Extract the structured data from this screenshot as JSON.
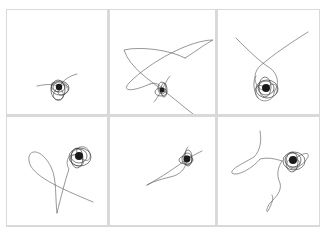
{
  "figure": {
    "background": "#ffffff",
    "frame_color": "#d9d9d9",
    "stroke_color": "#6a6a6a",
    "core_color": "#1a1a1a",
    "grid": {
      "rows": 2,
      "cols": 3
    },
    "panels": [
      {
        "id": "r1c1",
        "core": {
          "cx": 52,
          "cy": 77,
          "r": 3.2
        },
        "traces": [
          "M30 76 C 40 74, 46 74, 50 76",
          "M52 77 C 56 70, 62 66, 70 64",
          "M52 77 C 48 70, 42 72, 45 78 C 48 84, 56 82, 52 77",
          "M52 77 C 58 72, 64 76, 60 82 C 56 88, 48 86, 52 77",
          "M52 77 C 46 80, 44 88, 50 90 C 56 92, 60 84, 52 77",
          "M52 77 C 54 70, 60 72, 60 78"
        ],
        "dense_loops": [
          {
            "cx": 52,
            "cy": 77,
            "rx": 6,
            "ry": 5
          },
          {
            "cx": 53,
            "cy": 78,
            "rx": 9,
            "ry": 7
          },
          {
            "cx": 51,
            "cy": 80,
            "rx": 7,
            "ry": 10
          }
        ]
      },
      {
        "id": "r1c2",
        "core": {
          "cx": 52,
          "cy": 80,
          "r": 2.6
        },
        "traces": [
          "M52 80 C 40 70, 20 58, 14 40 C 30 36, 60 40, 75 48",
          "M75 48 C 85 42, 95 34, 103 30 C 80 30, 40 52, 20 72 C 10 82, 22 82, 40 74",
          "M40 74 C 46 72, 50 74, 52 80",
          "M52 80 C 62 86, 72 96, 83 104",
          "M52 80 C 48 86, 46 90, 44 92",
          "M52 80 C 56 72, 58 68, 60 66"
        ],
        "dense_loops": [
          {
            "cx": 52,
            "cy": 78,
            "rx": 4,
            "ry": 6
          },
          {
            "cx": 51,
            "cy": 82,
            "rx": 6,
            "ry": 4
          },
          {
            "cx": 54,
            "cy": 80,
            "rx": 3,
            "ry": 7
          }
        ]
      },
      {
        "id": "r1c3",
        "core": {
          "cx": 48,
          "cy": 78,
          "r": 4
        },
        "traces": [
          "M18 28 C 30 40, 42 52, 52 58 C 60 64, 62 74, 56 82",
          "M90 22 C 74 32, 56 44, 42 56 C 34 64, 36 76, 44 80",
          "M48 78 C 38 70, 34 82, 40 88 C 46 94, 58 90, 56 80",
          "M48 78 C 56 70, 62 76, 58 84",
          "M40 88 C 36 82, 34 72, 38 66"
        ],
        "dense_loops": [
          {
            "cx": 48,
            "cy": 78,
            "rx": 8,
            "ry": 7
          },
          {
            "cx": 49,
            "cy": 79,
            "rx": 11,
            "ry": 9
          },
          {
            "cx": 47,
            "cy": 77,
            "rx": 6,
            "ry": 10
          }
        ]
      },
      {
        "id": "r2c1",
        "core": {
          "cx": 72,
          "cy": 39,
          "r": 4
        },
        "traces": [
          "M72 39 C 60 34, 58 46, 62 52 C 58 64, 54 80, 50 96",
          "M50 96 C 48 80, 50 62, 44 50 C 34 30, 20 32, 22 44 C 24 58, 50 70, 86 85",
          "M72 39 C 64 30, 78 26, 82 34 C 86 42, 80 48, 72 39",
          "M72 39 C 80 44, 76 52, 68 48 C 60 44, 64 34, 72 39"
        ],
        "dense_loops": [
          {
            "cx": 72,
            "cy": 39,
            "rx": 8,
            "ry": 7
          },
          {
            "cx": 73,
            "cy": 40,
            "rx": 11,
            "ry": 9
          },
          {
            "cx": 70,
            "cy": 41,
            "rx": 6,
            "ry": 10
          }
        ]
      },
      {
        "id": "r2c2",
        "core": {
          "cx": 77,
          "cy": 42,
          "r": 3.4
        },
        "traces": [
          "M37 68 C 52 60, 66 50, 77 42 C 84 38, 88 36, 92 34",
          "M77 42 C 76 52, 70 58, 60 60 C 52 62, 44 64, 37 68",
          "M77 42 C 74 36, 76 32, 78 30"
        ],
        "dense_loops": [
          {
            "cx": 77,
            "cy": 42,
            "rx": 5,
            "ry": 6
          },
          {
            "cx": 76,
            "cy": 43,
            "rx": 7,
            "ry": 4
          },
          {
            "cx": 78,
            "cy": 41,
            "rx": 4,
            "ry": 8
          }
        ]
      },
      {
        "id": "r2c3",
        "core": {
          "cx": 75,
          "cy": 43,
          "r": 4
        },
        "traces": [
          "M42 14 C 44 24, 42 34, 36 40 C 26 46, 12 52, 14 56 C 18 60, 34 52, 42 42 C 50 40, 58 42, 64 44",
          "M64 44 C 60 50, 58 58, 62 66 C 64 74, 58 80, 52 86 C 48 92, 48 96, 50 94 C 54 86, 56 82, 54 78",
          "M75 43 C 84 36, 92 34, 90 40 C 86 48, 78 52, 72 50",
          "M75 43 C 66 40, 68 52, 76 52 C 84 52, 84 40, 75 43"
        ],
        "dense_loops": [
          {
            "cx": 75,
            "cy": 43,
            "rx": 8,
            "ry": 7
          },
          {
            "cx": 76,
            "cy": 44,
            "rx": 11,
            "ry": 9
          },
          {
            "cx": 74,
            "cy": 45,
            "rx": 6,
            "ry": 10
          }
        ]
      }
    ]
  }
}
